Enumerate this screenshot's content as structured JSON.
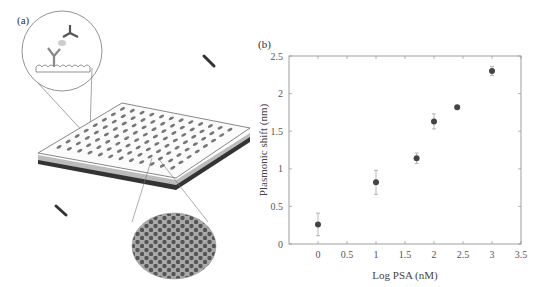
{
  "figure": {
    "panel_a_label": "(a)",
    "panel_b_label": "(b)",
    "illustration": {
      "description": "Microplate with plasmonic nanohole array; inset shows antibody sandwich capture on nanostructured surface",
      "icons": [
        "antibody-icon",
        "antigen-icon",
        "microplate-icon",
        "nanohole-array-icon",
        "pipette-tip-icon"
      ]
    }
  },
  "chart_data": {
    "type": "scatter",
    "title": "",
    "xlabel": "Log PSA (nM)",
    "ylabel": "Plasmonic shift (nm)",
    "xlim": [
      -0.5,
      3.5
    ],
    "ylim": [
      0,
      2.5
    ],
    "xticks": [
      0,
      0.5,
      1,
      1.5,
      2,
      2.5,
      3,
      3.5
    ],
    "xtick_labels": [
      "0",
      "0.5",
      "1",
      "1.5",
      "2",
      "2.5",
      "3",
      "3.5"
    ],
    "yticks": [
      0,
      0.5,
      1,
      1.5,
      2,
      2.5
    ],
    "ytick_labels": [
      "0",
      "0.5",
      "1",
      "1.5",
      "2",
      "2.5"
    ],
    "grid": false,
    "legend": null,
    "series": [
      {
        "name": "PSA response",
        "x": [
          0,
          1,
          1.7,
          2,
          2.4,
          3
        ],
        "y": [
          0.26,
          0.82,
          1.14,
          1.63,
          1.82,
          2.3
        ],
        "yerr": [
          0.15,
          0.16,
          0.07,
          0.1,
          0.02,
          0.06
        ]
      }
    ]
  }
}
